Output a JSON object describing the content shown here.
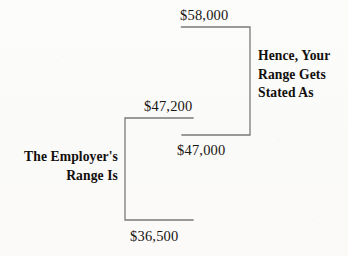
{
  "diagram": {
    "line_color": "#7c7a77",
    "text_color": "#191512",
    "background_color": "#fbfbfa"
  },
  "amounts": {
    "top_employer_max": "$58,000",
    "upper_candidate_max": "$47,200",
    "employer_mid": "$47,000",
    "employer_min": "$36,500"
  },
  "labels": {
    "employer_range": "The Employer's\nRange Is",
    "employer_range_line1": "The Employer's",
    "employer_range_line2": "Range Is",
    "hence_range": "Hence, Your\nRange Gets\nStated As",
    "hence_range_line1": "Hence, Your",
    "hence_range_line2": "Range Gets",
    "hence_range_line3": "Stated As"
  },
  "brackets": [
    {
      "name": "stated-range-bracket",
      "opens": "left",
      "top_value": "$58,000",
      "bottom_value": "$47,000",
      "top_y": 27,
      "bottom_y": 135,
      "spine_x": 250,
      "arm_x": 181
    },
    {
      "name": "employer-range-bracket",
      "opens": "right",
      "top_value": "$47,200",
      "bottom_value": "$36,500",
      "top_y": 118,
      "bottom_y": 220,
      "spine_x": 125,
      "arm_x": 193
    }
  ]
}
